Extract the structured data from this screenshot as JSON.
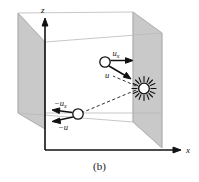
{
  "figure": {
    "caption": "(b)",
    "axes": {
      "vertical_label": "z",
      "horizontal_label": "x"
    },
    "labels": {
      "upper_horizontal_velocity": "u",
      "upper_horizontal_velocity_sub": "x",
      "upper_resultant_velocity": "u",
      "lower_horizontal_velocity": "−u",
      "lower_horizontal_velocity_sub": "x",
      "lower_resultant_velocity": "−u"
    },
    "objects": {
      "light_source_name": "light-source-starburst",
      "upper_particle_name": "upper-particle",
      "lower_particle_name": "lower-particle"
    },
    "colors": {
      "panel_fill": "#c9c9c9",
      "panel_stroke": "#8a8a8a",
      "box_edge": "#b5b5b5",
      "axis": "#111111",
      "ink": "#111111",
      "background": "#ffffff"
    }
  }
}
